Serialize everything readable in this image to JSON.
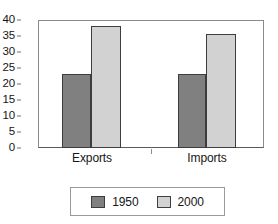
{
  "chart_data": {
    "type": "bar",
    "title": "",
    "subtitle": "",
    "xlabel": "",
    "ylabel": "",
    "categories": [
      "Exports",
      "Imports"
    ],
    "series": [
      {
        "name": "1950",
        "values": [
          23,
          23
        ],
        "color": "#808080"
      },
      {
        "name": "2000",
        "values": [
          38,
          35.5
        ],
        "color": "#d2d2d2"
      }
    ],
    "ylim": [
      0,
      40
    ],
    "yticks": [
      0,
      5,
      10,
      15,
      20,
      25,
      30,
      35,
      40
    ],
    "ytick_labels": [
      "0",
      "5",
      "10",
      "15",
      "20",
      "25",
      "30",
      "35",
      "40"
    ],
    "grid": false,
    "legend_position": "bottom",
    "frame": true
  },
  "legend": {
    "entries": [
      {
        "label": "1950",
        "color": "#808080"
      },
      {
        "label": "2000",
        "color": "#d2d2d2"
      }
    ]
  }
}
